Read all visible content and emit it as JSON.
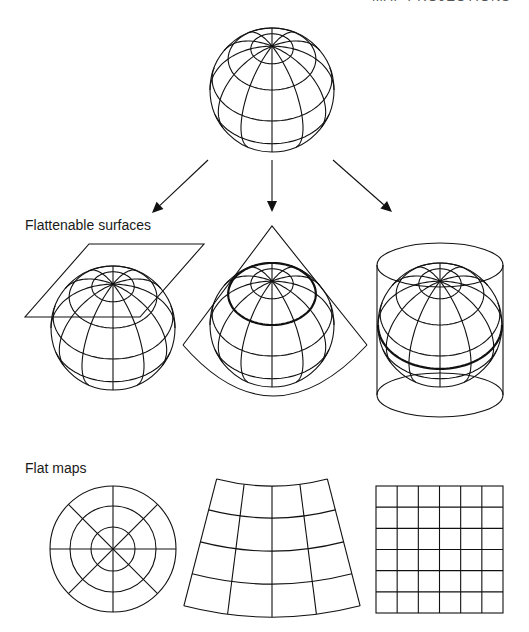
{
  "header": {
    "title": "MAP PROJECTIONS"
  },
  "labels": {
    "flattenable_surfaces": "Flattenable surfaces",
    "flat_maps": "Flat maps"
  },
  "colors": {
    "line": "#111111",
    "background": "#ffffff"
  },
  "globe": {
    "radius": 62,
    "tilt_deg": 45,
    "meridian_step_deg": 30,
    "parallels_deg": [
      70,
      45,
      15,
      -15
    ],
    "meridian_min_lat_deg": -45
  },
  "diagram": {
    "source_globe": {
      "cx": 272,
      "cy": 90
    },
    "arrows": [
      {
        "from": [
          208,
          160
        ],
        "to": [
          152,
          213
        ],
        "target": "plane"
      },
      {
        "from": [
          272,
          160
        ],
        "to": [
          272,
          212
        ],
        "target": "cone"
      },
      {
        "from": [
          333,
          160
        ],
        "to": [
          392,
          212
        ],
        "target": "cylinder"
      }
    ],
    "surfaces": [
      {
        "type": "plane",
        "globe": {
          "cx": 113,
          "cy": 328
        },
        "plane_points": [
          [
            89,
            244
          ],
          [
            204,
            244
          ],
          [
            140,
            317
          ],
          [
            25,
            317
          ]
        ]
      },
      {
        "type": "cone",
        "globe": {
          "cx": 272,
          "cy": 325
        },
        "apex": [
          272,
          226
        ],
        "base_left": [
          183,
          345
        ],
        "base_right": [
          367,
          345
        ],
        "base_bottom_y": 398,
        "tangent_parallel_deg": 45
      },
      {
        "type": "cylinder",
        "globe": {
          "cx": 440,
          "cy": 325
        },
        "left_x": 377,
        "right_x": 503,
        "top_cy": 265,
        "bottom_cy": 395,
        "ellipse_ry": 22,
        "tangent_parallel_deg": 0
      }
    ],
    "flat_maps": [
      {
        "type": "azimuthal",
        "cx": 113,
        "cy": 549,
        "rings": [
          22,
          43,
          63
        ],
        "spokes": 8
      },
      {
        "type": "conic",
        "apex": [
          272,
          265
        ],
        "radii": [
          221,
          253,
          286,
          319,
          352
        ],
        "half_angle_deg": 14.5,
        "meridians": 5
      },
      {
        "type": "cylindrical",
        "x": 376,
        "y": 486,
        "width": 127,
        "height": 127,
        "cols": 6,
        "rows": 6
      }
    ]
  }
}
